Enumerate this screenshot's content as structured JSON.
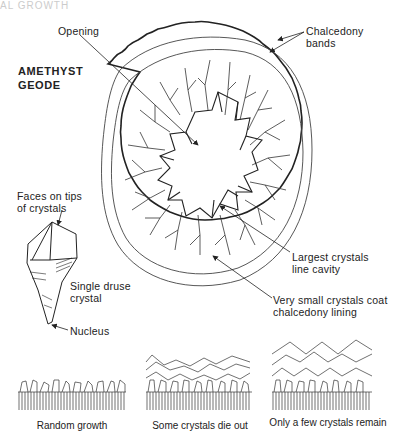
{
  "header": {
    "cut_off_text": "AL GROWTH"
  },
  "geode": {
    "title_line1": "AMETHYST",
    "title_line2": "GEODE",
    "labels": {
      "opening": "Opening",
      "chalcedony_line1": "Chalcedony",
      "chalcedony_line2": "bands",
      "largest_line1": "Largest crystals",
      "largest_line2": "line cavity",
      "small_line1": "Very small crystals coat",
      "small_line2": "chalcedony lining"
    }
  },
  "crystal": {
    "faces_line1": "Faces on tips",
    "faces_line2": "of crystals",
    "single_line1": "Single druse",
    "single_line2": "crystal",
    "nucleus": "Nucleus"
  },
  "growth_stages": [
    {
      "caption": "Random growth"
    },
    {
      "caption": "Some crystals die out"
    },
    {
      "caption": "Only a few crystals remain"
    }
  ],
  "colors": {
    "line": "#222222",
    "background": "#ffffff"
  }
}
